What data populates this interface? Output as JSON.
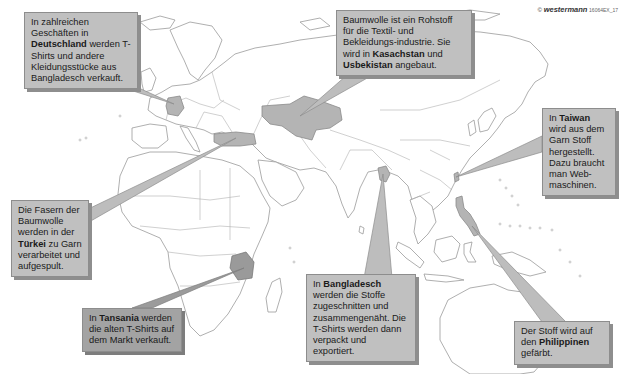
{
  "map": {
    "title": "Weg eines T-Shirts",
    "highlighted_countries": [
      "Deutschland",
      "Kasachstan",
      "Usbekistan",
      "Türkei",
      "Tansania",
      "Bangladesch",
      "Taiwan",
      "Philippinen"
    ],
    "colors": {
      "box_fill": "#c0c0c0",
      "box_dark_fill": "#a3a3a3",
      "highlight": "#b4b4b4",
      "land_stroke": "#9a9a9a",
      "background": "#ffffff"
    }
  },
  "copyright": {
    "symbol": "©",
    "brand": "westermann",
    "code": "16064EX_17"
  },
  "callouts": {
    "deutschland": {
      "pre": "In zahlreichen Geschäften in ",
      "bold": "Deutschland",
      "post": " werden T-Shirts und andere Kleidungsstücke aus Bangladesch verkauft."
    },
    "kasachstan": {
      "pre": "Baumwolle ist ein Rohstoff für die Textil- und Bekleidungs-industrie. Sie wird in ",
      "bold": "Kasachstan",
      "mid": " und ",
      "bold2": "Usbekistan",
      "post": " angebaut."
    },
    "taiwan": {
      "pre": "In ",
      "bold": "Taiwan",
      "post": " wird aus dem Garn Stoff hergestellt. Dazu braucht man Web-maschinen."
    },
    "tuerkei": {
      "pre": "Die Fasern der Baumwolle werden in der ",
      "bold": "Türkei",
      "post": " zu Garn verarbeitet und aufgespult."
    },
    "tansania": {
      "pre": "In ",
      "bold": "Tansania",
      "post": " werden die alten T-Shirts auf dem Markt verkauft."
    },
    "bangladesch": {
      "pre": "In ",
      "bold": "Bangladesch",
      "post": " werden die Stoffe zugeschnitten und zusammengenäht. Die T-Shirts werden dann verpackt und exportiert."
    },
    "philippinen": {
      "pre": "Der Stoff wird auf den ",
      "bold": "Philippinen",
      "post": " gefärbt."
    }
  }
}
